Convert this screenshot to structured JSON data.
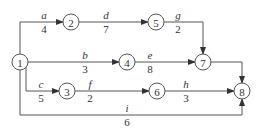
{
  "diagram": {
    "type": "activity-network",
    "nodes": [
      "1",
      "2",
      "3",
      "4",
      "5",
      "6",
      "7",
      "8"
    ],
    "edges": [
      {
        "from": "1",
        "to": "2",
        "activity": "a",
        "duration": "4"
      },
      {
        "from": "2",
        "to": "5",
        "activity": "d",
        "duration": "7"
      },
      {
        "from": "5",
        "to": "7",
        "activity": "g",
        "duration": "2"
      },
      {
        "from": "1",
        "to": "4",
        "activity": "b",
        "duration": "3"
      },
      {
        "from": "4",
        "to": "7",
        "activity": "e",
        "duration": "8"
      },
      {
        "from": "7",
        "to": "8",
        "activity": "",
        "duration": ""
      },
      {
        "from": "1",
        "to": "3",
        "activity": "c",
        "duration": "5"
      },
      {
        "from": "3",
        "to": "6",
        "activity": "f",
        "duration": "2"
      },
      {
        "from": "6",
        "to": "8",
        "activity": "h",
        "duration": "3"
      },
      {
        "from": "1",
        "to": "8",
        "activity": "i",
        "duration": "6"
      }
    ]
  }
}
